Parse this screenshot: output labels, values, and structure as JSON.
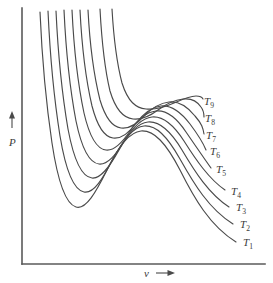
{
  "figure": {
    "title": "",
    "background_color": "#ffffff",
    "curve_color": "#4a4a4a",
    "axis_color": "#5a5a5a",
    "text_color": "#3a3a3a"
  },
  "axes": {
    "y": {
      "label": "P",
      "arrow": "up-arrow",
      "label_x": 12,
      "label_y": 142,
      "arrow_x": 12,
      "arrow_top_y": 113,
      "arrow_bottom_y": 128,
      "line_x": 22,
      "line_top_y": 8,
      "line_bottom_y": 264
    },
    "x": {
      "label": "v",
      "arrow": "right-arrow",
      "label_x": 146,
      "label_y": 276,
      "arrow_left_x": 156,
      "arrow_right_x": 176,
      "arrow_y": 272,
      "line_y": 264,
      "line_left_x": 22,
      "line_right_x": 265
    }
  },
  "chart_data": {
    "type": "line",
    "title": "",
    "xlabel": "v",
    "ylabel": "P",
    "grid": false,
    "legend_position": "inline-right-of-curve-ends",
    "series": [
      {
        "name": "T_1",
        "label": "T",
        "subscript": "1",
        "temperature_rank": 1,
        "label_x": 243,
        "label_y": 246,
        "path": "M 40,12 C 41.5,46 45,96 52,143 C 58,183 66,204 76,207 C 86,210 96,192 107,170 C 118,147 129,132 141,131 C 154,130 166,143 180,170 C 194,198 210,226 236,242"
      },
      {
        "name": "T_2",
        "label": "T",
        "subscript": "2",
        "temperature_rank": 2,
        "label_x": 240,
        "label_y": 228,
        "path": "M 48,11 C 49.5,44 53,92 60,136 C 66,172 74,190 84,192 C 94,194 103,178 113,159 C 123,140 133,127 144,126 C 156,125 167,136 180,159 C 194,184 209,209 233,224"
      },
      {
        "name": "T_3",
        "label": "T",
        "subscript": "3",
        "temperature_rank": 3,
        "label_x": 236,
        "label_y": 211,
        "path": "M 56,11 C 57.5,43 61,88 68,129 C 74,161 82,177 92,178 C 101,179 110,166 119,150 C 128,134 138,123 148,122 C 159,121 170,130 182,150 C 195,172 209,194 229,207"
      },
      {
        "name": "T_4",
        "label": "T",
        "subscript": "4",
        "temperature_rank": 4,
        "label_x": 231,
        "label_y": 195,
        "path": "M 64,10 C 65.5,42 69,84 76,121 C 82,150 90,163 99,164 C 108,165 116,155 124,141 C 133,127 142,118 152,117 C 162,116 173,124 184,141 C 196,160 209,179 225,190"
      },
      {
        "name": "T_5",
        "label": "T",
        "subscript": "5",
        "temperature_rank": 5,
        "label_x": 216,
        "label_y": 173,
        "path": "M 72,10 C 73.5,41 77,80 84,113 C 90,139 97,149 106,150 C 114,151 122,143 130,131 C 138,119 147,112 156,111 C 166,110 176,117 186,132 C 197,148 208,164 211,168"
      },
      {
        "name": "T_6",
        "label": "T",
        "subscript": "6",
        "temperature_rank": 6,
        "label_x": 210,
        "label_y": 155,
        "path": "M 80,10 C 81.5,40 85,76 92,106 C 98,129 105,137 113,138 C 121,139 129,133 136,123 C 144,113 152,107 161,106 C 171,105 180,111 190,124 C 199,136 204,145 206,150"
      },
      {
        "name": "T_7",
        "label": "T",
        "subscript": "7",
        "temperature_rank": 7,
        "label_x": 206,
        "label_y": 139,
        "path": "M 88,10 C 89.5,39 93,72 100,100 C 106,120 113,127 121,128 C 129,129 137,124 144,116 C 152,108 160,103 169,102 C 178,101 187,106 195,116 C 202,124 203,128 204,134"
      },
      {
        "name": "T_8",
        "label": "T",
        "subscript": "8",
        "temperature_rank": 8,
        "label_x": 205,
        "label_y": 122,
        "path": "M 100,9 C 101.5,37 104,66 110,91 C 116,111 124,118 133,119 C 142,120 150,116 158,110 C 166,104 174,100 183,99 C 191,98 197,101 201,107 C 204,111 204,114 204,117"
      },
      {
        "name": "T_9",
        "label": "T",
        "subscript": "9",
        "temperature_rank": 9,
        "label_x": 204,
        "label_y": 105,
        "path": "M 112,9 C 113.5,35 116,60 122,83 C 128,102 136,108 146,109 C 156,110 165,107 174,103 C 183,99 190,96 196,96 C 200,96 202,97 203,99"
      }
    ]
  }
}
